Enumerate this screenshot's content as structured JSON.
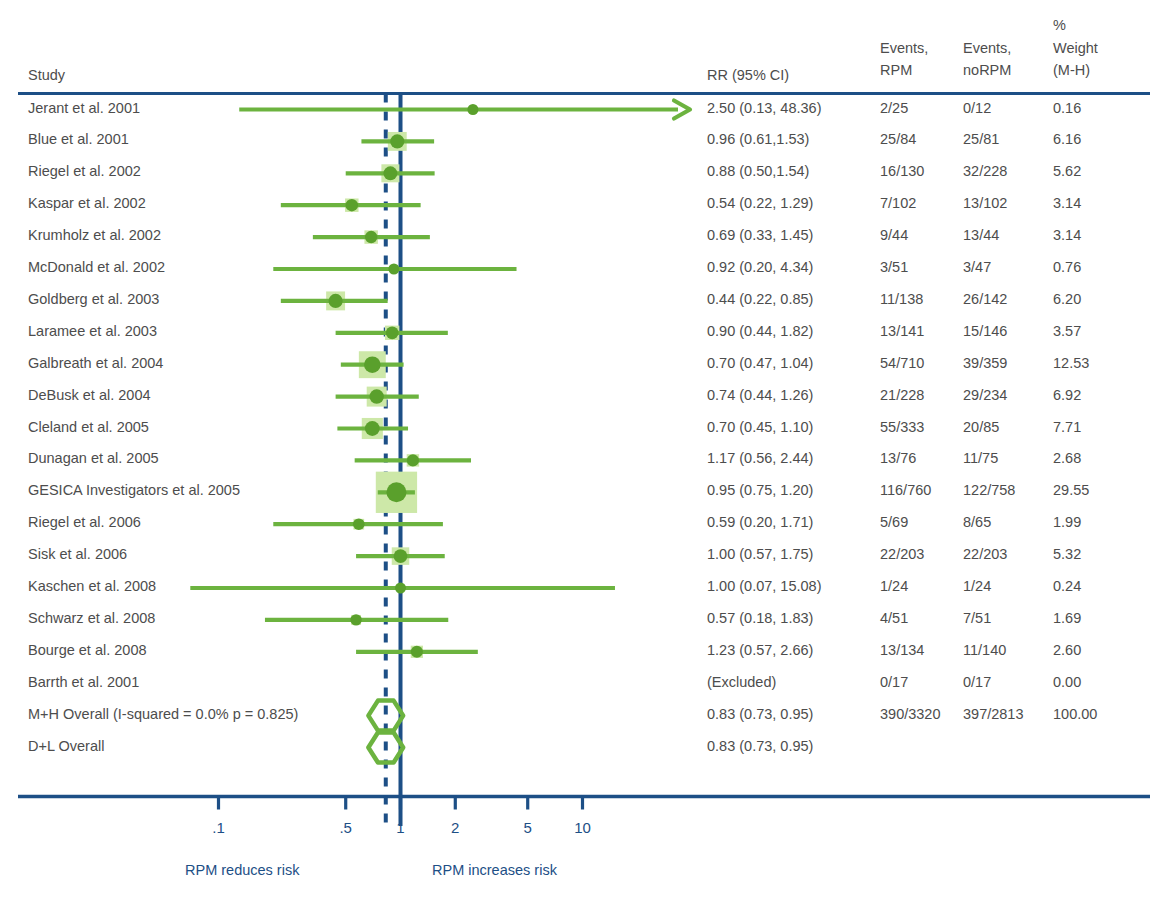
{
  "meta": {
    "figure_type": "forest-plot",
    "colors": {
      "rule": "#1d4f86",
      "null_line": "#1d4f86",
      "summary_line": "#1d4f86",
      "marker": "#6cb33f",
      "marker_dark": "#5aa02c",
      "weight_box": "#cde8a8",
      "text": "#4d4d4d",
      "axis_text": "#1d4f86"
    }
  },
  "header": {
    "study": "Study",
    "rr": "RR (95% CI)",
    "events_rpm_l1": "Events,",
    "events_rpm_l2": "RPM",
    "events_norpm_l1": "Events,",
    "events_norpm_l2": "noRPM",
    "weight_l1": "%",
    "weight_l2": "Weight",
    "weight_l3": "(M-H)"
  },
  "axis": {
    "ticks": [
      ".1",
      ".5",
      "1",
      "2",
      "5",
      "10"
    ],
    "tick_values": [
      0.1,
      0.5,
      1,
      2,
      5,
      10
    ],
    "left_note": "RPM reduces risk",
    "right_note": "RPM increases risk",
    "null_value": 1,
    "summary_value": 0.83,
    "scale": "log"
  },
  "chart_data": {
    "type": "forest",
    "title": "",
    "xlabel": "",
    "ylabel": "",
    "xscale": "log",
    "xlim": [
      0.07,
      15.1
    ],
    "effect_measure": "RR",
    "rows": [
      {
        "study": "Jerant et al. 2001",
        "rr_text": "2.50 (0.13, 48.36)",
        "est": 2.5,
        "lo": 0.13,
        "hi": 48.36,
        "events_rpm": "2/25",
        "events_norpm": "0/12",
        "weight": "0.16",
        "weight_num": 0.16,
        "clipped_right": true
      },
      {
        "study": "Blue et al. 2001",
        "rr_text": "0.96 (0.61,1.53)",
        "est": 0.96,
        "lo": 0.61,
        "hi": 1.53,
        "events_rpm": "25/84",
        "events_norpm": "25/81",
        "weight": "6.16",
        "weight_num": 6.16,
        "clipped_right": false
      },
      {
        "study": "Riegel et al. 2002",
        "rr_text": "0.88 (0.50,1.54)",
        "est": 0.88,
        "lo": 0.5,
        "hi": 1.54,
        "events_rpm": "16/130",
        "events_norpm": "32/228",
        "weight": "5.62",
        "weight_num": 5.62,
        "clipped_right": false
      },
      {
        "study": "Kaspar et al. 2002",
        "rr_text": "0.54 (0.22, 1.29)",
        "est": 0.54,
        "lo": 0.22,
        "hi": 1.29,
        "events_rpm": "7/102",
        "events_norpm": "13/102",
        "weight": "3.14",
        "weight_num": 3.14,
        "clipped_right": false
      },
      {
        "study": "Krumholz et al. 2002",
        "rr_text": "0.69 (0.33, 1.45)",
        "est": 0.69,
        "lo": 0.33,
        "hi": 1.45,
        "events_rpm": "9/44",
        "events_norpm": "13/44",
        "weight": "3.14",
        "weight_num": 3.14,
        "clipped_right": false
      },
      {
        "study": "McDonald et al. 2002",
        "rr_text": "0.92 (0.20, 4.34)",
        "est": 0.92,
        "lo": 0.2,
        "hi": 4.34,
        "events_rpm": "3/51",
        "events_norpm": "3/47",
        "weight": "0.76",
        "weight_num": 0.76,
        "clipped_right": false
      },
      {
        "study": "Goldberg et al. 2003",
        "rr_text": "0.44 (0.22, 0.85)",
        "est": 0.44,
        "lo": 0.22,
        "hi": 0.85,
        "events_rpm": "11/138",
        "events_norpm": "26/142",
        "weight": "6.20",
        "weight_num": 6.2,
        "clipped_right": false
      },
      {
        "study": "Laramee et al. 2003",
        "rr_text": "0.90 (0.44, 1.82)",
        "est": 0.9,
        "lo": 0.44,
        "hi": 1.82,
        "events_rpm": "13/141",
        "events_norpm": "15/146",
        "weight": "3.57",
        "weight_num": 3.57,
        "clipped_right": false
      },
      {
        "study": "Galbreath et al. 2004",
        "rr_text": "0.70 (0.47, 1.04)",
        "est": 0.7,
        "lo": 0.47,
        "hi": 1.04,
        "events_rpm": "54/710",
        "events_norpm": "39/359",
        "weight": "12.53",
        "weight_num": 12.53,
        "clipped_right": false
      },
      {
        "study": "DeBusk et al. 2004",
        "rr_text": "0.74 (0.44, 1.26)",
        "est": 0.74,
        "lo": 0.44,
        "hi": 1.26,
        "events_rpm": "21/228",
        "events_norpm": "29/234",
        "weight": "6.92",
        "weight_num": 6.92,
        "clipped_right": false
      },
      {
        "study": "Cleland et al. 2005",
        "rr_text": "0.70 (0.45, 1.10)",
        "est": 0.7,
        "lo": 0.45,
        "hi": 1.1,
        "events_rpm": "55/333",
        "events_norpm": "20/85",
        "weight": "7.71",
        "weight_num": 7.71,
        "clipped_right": false
      },
      {
        "study": "Dunagan et al. 2005",
        "rr_text": "1.17 (0.56, 2.44)",
        "est": 1.17,
        "lo": 0.56,
        "hi": 2.44,
        "events_rpm": "13/76",
        "events_norpm": "11/75",
        "weight": "2.68",
        "weight_num": 2.68,
        "clipped_right": false
      },
      {
        "study": "GESICA Investigators et al. 2005",
        "rr_text": "0.95 (0.75, 1.20)",
        "est": 0.95,
        "lo": 0.75,
        "hi": 1.2,
        "events_rpm": "116/760",
        "events_norpm": "122/758",
        "weight": "29.55",
        "weight_num": 29.55,
        "clipped_right": false
      },
      {
        "study": "Riegel et al. 2006",
        "rr_text": "0.59 (0.20, 1.71)",
        "est": 0.59,
        "lo": 0.2,
        "hi": 1.71,
        "events_rpm": "5/69",
        "events_norpm": "8/65",
        "weight": "1.99",
        "weight_num": 1.99,
        "clipped_right": false
      },
      {
        "study": "Sisk et al. 2006",
        "rr_text": "1.00 (0.57, 1.75)",
        "est": 1.0,
        "lo": 0.57,
        "hi": 1.75,
        "events_rpm": "22/203",
        "events_norpm": "22/203",
        "weight": "5.32",
        "weight_num": 5.32,
        "clipped_right": false
      },
      {
        "study": "Kaschen et al. 2008",
        "rr_text": "1.00 (0.07, 15.08)",
        "est": 1.0,
        "lo": 0.07,
        "hi": 15.08,
        "events_rpm": "1/24",
        "events_norpm": "1/24",
        "weight": "0.24",
        "weight_num": 0.24,
        "clipped_right": false
      },
      {
        "study": "Schwarz et al. 2008",
        "rr_text": "0.57 (0.18, 1.83)",
        "est": 0.57,
        "lo": 0.18,
        "hi": 1.83,
        "events_rpm": "4/51",
        "events_norpm": "7/51",
        "weight": "1.69",
        "weight_num": 1.69,
        "clipped_right": false
      },
      {
        "study": "Bourge et al. 2008",
        "rr_text": "1.23 (0.57, 2.66)",
        "est": 1.23,
        "lo": 0.57,
        "hi": 2.66,
        "events_rpm": "13/134",
        "events_norpm": "11/140",
        "weight": "2.60",
        "weight_num": 2.6,
        "clipped_right": false
      },
      {
        "study": "Barrth et al. 2001",
        "rr_text": "(Excluded)",
        "est": null,
        "lo": null,
        "hi": null,
        "events_rpm": "0/17",
        "events_norpm": "0/17",
        "weight": "0.00",
        "weight_num": 0.0,
        "clipped_right": false
      }
    ],
    "summaries": [
      {
        "study": "M+H Overall (I-squared = 0.0% p = 0.825)",
        "rr_text": "0.83 (0.73, 0.95)",
        "est": 0.83,
        "lo": 0.73,
        "hi": 0.95,
        "events_rpm": "390/3320",
        "events_norpm": "397/2813",
        "weight": "100.00"
      },
      {
        "study": "D+L Overall",
        "rr_text": "0.83 (0.73, 0.95)",
        "est": 0.83,
        "lo": 0.73,
        "hi": 0.95,
        "events_rpm": "",
        "events_norpm": "",
        "weight": ""
      }
    ]
  }
}
